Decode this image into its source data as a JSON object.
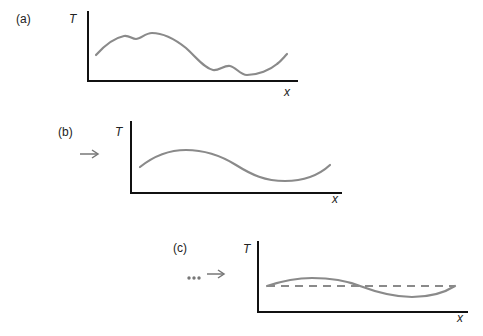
{
  "figure": {
    "colors": {
      "axis": "#111111",
      "curve": "#8a8a8a",
      "text": "#222222"
    },
    "panels": [
      {
        "label": "(a)",
        "y_axis_label": "T",
        "x_axis_label": "x",
        "curve": "irregular wavy profile"
      },
      {
        "label": "(b)",
        "y_axis_label": "T",
        "x_axis_label": "x",
        "curve": "smooth single wave",
        "lead_arrow": "→"
      },
      {
        "label": "(c)",
        "y_axis_label": "T",
        "x_axis_label": "x",
        "curve": "low-amplitude wave about dashed mean line",
        "lead_ellipsis": "•••",
        "lead_arrow": "→"
      }
    ]
  }
}
